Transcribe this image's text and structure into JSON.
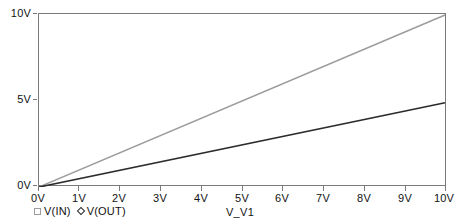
{
  "chart_data": {
    "type": "line",
    "title": "",
    "subtitle": "",
    "xlabel": "V_V1",
    "ylabel": "",
    "xlim": [
      0,
      10
    ],
    "ylim": [
      0,
      10
    ],
    "grid": false,
    "legend_position": "bottom-left",
    "x": [
      0,
      10
    ],
    "x_tick_labels": [
      "0V",
      "1V",
      "2V",
      "3V",
      "4V",
      "5V",
      "6V",
      "7V",
      "8V",
      "9V",
      "10V"
    ],
    "x_tick_values": [
      0,
      1,
      2,
      3,
      4,
      5,
      6,
      7,
      8,
      9,
      10
    ],
    "y_tick_labels": [
      "0V",
      "5V",
      "10V"
    ],
    "y_tick_values": [
      0,
      5,
      10
    ],
    "series": [
      {
        "name": "V(IN)",
        "marker": "square",
        "color": "#9c9c9c",
        "x": [
          0,
          10
        ],
        "values": [
          0,
          10
        ]
      },
      {
        "name": "V(OUT)",
        "marker": "diamond",
        "color": "#2b2b2b",
        "x": [
          0,
          10
        ],
        "values": [
          0,
          4.9
        ]
      }
    ]
  },
  "axes": {
    "x_title": "V_V1",
    "x_ticks": [
      {
        "label": "0V",
        "value": 0
      },
      {
        "label": "1V",
        "value": 1
      },
      {
        "label": "2V",
        "value": 2
      },
      {
        "label": "3V",
        "value": 3
      },
      {
        "label": "4V",
        "value": 4
      },
      {
        "label": "5V",
        "value": 5
      },
      {
        "label": "6V",
        "value": 6
      },
      {
        "label": "7V",
        "value": 7
      },
      {
        "label": "8V",
        "value": 8
      },
      {
        "label": "9V",
        "value": 9
      },
      {
        "label": "10V",
        "value": 10
      }
    ],
    "y_ticks": [
      {
        "label": "10V",
        "value": 10
      },
      {
        "label": "5V",
        "value": 5
      },
      {
        "label": "0V",
        "value": 0
      }
    ]
  },
  "legend": {
    "entries": [
      {
        "label": "V(IN)",
        "marker": "square",
        "color": "#9c9c9c"
      },
      {
        "label": "V(OUT)",
        "marker": "diamond",
        "color": "#2b2b2b"
      }
    ]
  },
  "colors": {
    "v_in": "#9c9c9c",
    "v_out": "#2b2b2b",
    "axis": "#7a7a7a",
    "background": "#ffffff",
    "text": "#111111"
  }
}
